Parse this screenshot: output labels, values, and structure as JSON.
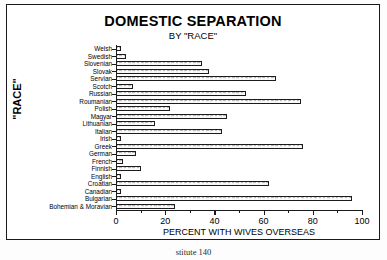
{
  "figure": {
    "title": "DOMESTIC SEPARATION",
    "subtitle": "BY \"RACE\"",
    "page_caption": "stitute 140"
  },
  "chart_data": {
    "type": "bar",
    "orientation": "horizontal",
    "title": "DOMESTIC SEPARATION",
    "subtitle": "BY \"RACE\"",
    "xlabel": "PERCENT WITH WIVES OVERSEAS",
    "ylabel": "\"RACE\"",
    "xlim": [
      0,
      100
    ],
    "xticks": [
      0,
      20,
      40,
      60,
      80,
      100
    ],
    "xtick_labels": [
      "0",
      "20",
      "40",
      "60",
      "80",
      "100"
    ],
    "grid": false,
    "legend": false,
    "categories": [
      "Welsh",
      "Swedish",
      "Slovenian",
      "Slovak",
      "Servian",
      "Scotch",
      "Russian",
      "Roumanian",
      "Polish",
      "Magyar",
      "Lithuanian",
      "Italian",
      "Irish",
      "Greek",
      "German",
      "French",
      "Finnish",
      "English",
      "Croatian",
      "Canadian",
      "Bulgarian",
      "Bohemian & Moravian"
    ],
    "values": [
      2,
      4,
      35,
      38,
      65,
      7,
      53,
      75,
      22,
      45,
      16,
      43,
      2,
      76,
      8,
      3,
      10,
      2,
      62,
      2,
      96,
      24
    ]
  }
}
